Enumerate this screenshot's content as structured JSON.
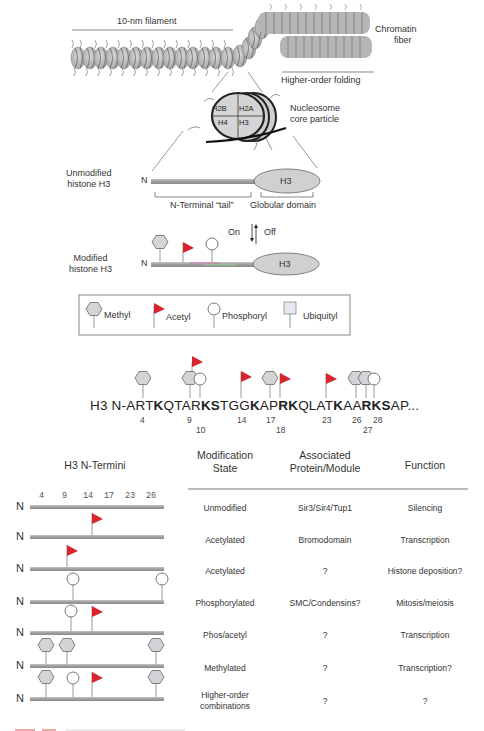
{
  "top": {
    "filament_label": "10-nm filament",
    "fiber_label": [
      "Chromatin",
      "fiber"
    ],
    "folding_label": "Higher-order folding",
    "nucleosome_label": [
      "Nucleosome",
      "core particle"
    ],
    "histones": [
      "H2B",
      "H2A",
      "H4",
      "H3"
    ]
  },
  "unmodified": {
    "label": [
      "Unmodified",
      "histone H3"
    ],
    "n": "N",
    "globular": "H3",
    "tail_label": "N-Terminal “tail”",
    "domain_label": "Globular domain"
  },
  "equilibrium": {
    "on": "On",
    "off": "Off"
  },
  "modified": {
    "label": [
      "Modified",
      "histone H3"
    ],
    "n": "N",
    "globular": "H3"
  },
  "legend": {
    "items": [
      {
        "icon": "hexagon-icon",
        "label": "Methyl"
      },
      {
        "icon": "flag-icon",
        "label": "Acetyl"
      },
      {
        "icon": "circle-icon",
        "label": "Phosphoryl"
      },
      {
        "icon": "square-icon",
        "label": "Ubiquityl"
      }
    ]
  },
  "sequence": {
    "prefix": "H3 N-ART",
    "parts": [
      {
        "t": "H3 N-ART",
        "b": false
      },
      {
        "t": "K",
        "b": true
      },
      {
        "t": "QTAR",
        "b": false
      },
      {
        "t": "KS",
        "b": true
      },
      {
        "t": "TGG",
        "b": false
      },
      {
        "t": "K",
        "b": true
      },
      {
        "t": "AP",
        "b": false
      },
      {
        "t": "RK",
        "b": true
      },
      {
        "t": "QLAT",
        "b": false
      },
      {
        "t": "K",
        "b": true
      },
      {
        "t": "AA",
        "b": false
      },
      {
        "t": "RKS",
        "b": true
      },
      {
        "t": "AP...",
        "b": false
      }
    ],
    "positions": [
      "4",
      "9",
      "10",
      "14",
      "17",
      "18",
      "23",
      "26",
      "27",
      "28"
    ]
  },
  "table": {
    "left_header": "H3 N-Termini",
    "scale": [
      "4",
      "9",
      "14",
      "17",
      "23",
      "26"
    ],
    "headers": [
      [
        "Modification",
        "State"
      ],
      [
        "Associated",
        "Protein/Module"
      ],
      [
        "",
        "Function"
      ]
    ],
    "rows": [
      {
        "state": "Unmodified",
        "protein": "Sir3/Sir4/Tup1",
        "function": "Silencing"
      },
      {
        "state": "Acetylated",
        "protein": "Bromodomain",
        "function": "Transcription"
      },
      {
        "state": "Acetylated",
        "protein": "?",
        "function": "Histone deposition?"
      },
      {
        "state": "Phosphorylated",
        "protein": "SMC/Condensins?",
        "function": "Mitosis/meiosis"
      },
      {
        "state": "Phos/acetyl",
        "protein": "?",
        "function": "Transcription"
      },
      {
        "state": "Methylated",
        "protein": "?",
        "function": "Transcription?"
      },
      {
        "state": "Higher-order",
        "state2": "combinations",
        "protein": "?",
        "function": "?"
      }
    ],
    "n_label": "N"
  },
  "colors": {
    "acetyl_red": "#d8242c",
    "shape_gray": "#d2d4d8",
    "bar_gray": "#a9a9a9",
    "text": "#333333"
  }
}
